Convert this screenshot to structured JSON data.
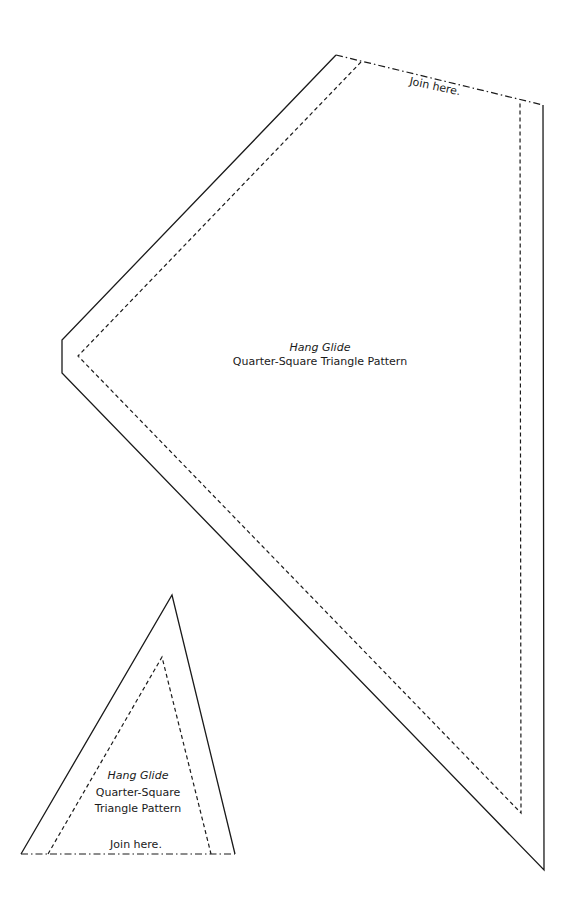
{
  "page": {
    "background": "#ffffff",
    "line_color": "#1a1a1a"
  },
  "large_piece": {
    "title": "Hang Glide",
    "subtitle": "Quarter-Square Triangle Pattern",
    "join_label": "Join here."
  },
  "small_piece": {
    "title": "Hang Glide",
    "subtitle_line1": "Quarter-Square",
    "subtitle_line2": "Triangle Pattern",
    "join_label": "Join here."
  }
}
